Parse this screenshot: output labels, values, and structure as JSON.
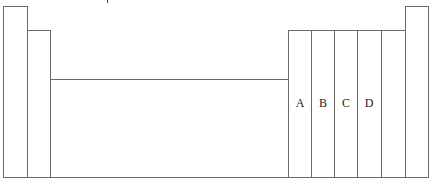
{
  "diagram": {
    "type": "periodic-table-outline",
    "stroke_color": "#6a6a6a",
    "background": "#ffffff",
    "bottom_y": 177,
    "columns": [
      {
        "id": "group-1",
        "x": 3,
        "width": 24,
        "top": 6,
        "label": ""
      },
      {
        "id": "group-2",
        "x": 27,
        "width": 23,
        "top": 30,
        "label": ""
      },
      {
        "id": "transition-block",
        "x": 50,
        "width": 239,
        "top": 79,
        "label": ""
      },
      {
        "id": "group-13",
        "x": 288,
        "width": 24,
        "top": 30,
        "label": "A"
      },
      {
        "id": "group-14",
        "x": 311,
        "width": 24,
        "top": 30,
        "label": "B"
      },
      {
        "id": "group-15",
        "x": 334,
        "width": 24,
        "top": 30,
        "label": "C"
      },
      {
        "id": "group-16",
        "x": 357,
        "width": 25,
        "top": 30,
        "label": "D"
      },
      {
        "id": "group-17",
        "x": 381,
        "width": 25,
        "top": 30,
        "label": ""
      },
      {
        "id": "group-18",
        "x": 405,
        "width": 23,
        "top": 6,
        "label": ""
      }
    ],
    "labels": {
      "a": "A",
      "b": "B",
      "c": "C",
      "d": "D"
    }
  }
}
